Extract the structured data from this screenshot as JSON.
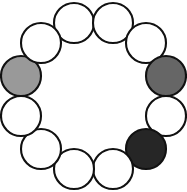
{
  "figure": {
    "background_color": "#ffffff",
    "width": 187,
    "height": 192
  },
  "diagram": {
    "type": "node-ring",
    "layout": "circular",
    "node_count": 12,
    "ring_center_x": 93.5,
    "ring_center_y": 96,
    "ring_radius": 75,
    "node_radius": 20,
    "stroke_color": "#111111",
    "stroke_width": 2.1,
    "fill_default": "#ffffff",
    "palette": {
      "empty": "#ffffff",
      "light_gray": "#999999",
      "medium_gray": "#666666",
      "dark_gray": "#262626"
    },
    "nodes": [
      {
        "id": "n1",
        "index": 0,
        "angle_deg": -105,
        "cx": 74,
        "cy": 23,
        "r": 20,
        "fill": "#ffffff",
        "state": "empty",
        "label": ""
      },
      {
        "id": "n2",
        "index": 1,
        "angle_deg": -75,
        "cx": 113,
        "cy": 23,
        "r": 20,
        "fill": "#ffffff",
        "state": "empty",
        "label": ""
      },
      {
        "id": "n3",
        "index": 2,
        "angle_deg": -45,
        "cx": 146,
        "cy": 43,
        "r": 20,
        "fill": "#ffffff",
        "state": "empty",
        "label": ""
      },
      {
        "id": "n4",
        "index": 3,
        "angle_deg": -15,
        "cx": 166,
        "cy": 76,
        "r": 20,
        "fill": "#666666",
        "state": "medium_gray",
        "label": ""
      },
      {
        "id": "n5",
        "index": 4,
        "angle_deg": 15,
        "cx": 166,
        "cy": 116,
        "r": 20,
        "fill": "#ffffff",
        "state": "empty",
        "label": ""
      },
      {
        "id": "n6",
        "index": 5,
        "angle_deg": 45,
        "cx": 146,
        "cy": 149,
        "r": 20,
        "fill": "#262626",
        "state": "dark_gray",
        "label": ""
      },
      {
        "id": "n7",
        "index": 6,
        "angle_deg": 75,
        "cx": 113,
        "cy": 169,
        "r": 20,
        "fill": "#ffffff",
        "state": "empty",
        "label": ""
      },
      {
        "id": "n8",
        "index": 7,
        "angle_deg": 105,
        "cx": 74,
        "cy": 169,
        "r": 20,
        "fill": "#ffffff",
        "state": "empty",
        "label": ""
      },
      {
        "id": "n9",
        "index": 8,
        "angle_deg": 135,
        "cx": 41,
        "cy": 149,
        "r": 20,
        "fill": "#ffffff",
        "state": "empty",
        "label": ""
      },
      {
        "id": "n10",
        "index": 9,
        "angle_deg": 165,
        "cx": 21,
        "cy": 116,
        "r": 20,
        "fill": "#ffffff",
        "state": "empty",
        "label": ""
      },
      {
        "id": "n11",
        "index": 10,
        "angle_deg": -165,
        "cx": 21,
        "cy": 76,
        "r": 20,
        "fill": "#999999",
        "state": "light_gray",
        "label": ""
      },
      {
        "id": "n12",
        "index": 11,
        "angle_deg": -135,
        "cx": 41,
        "cy": 43,
        "r": 20,
        "fill": "#ffffff",
        "state": "empty",
        "label": ""
      }
    ]
  }
}
